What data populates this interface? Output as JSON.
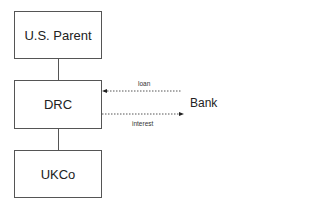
{
  "diagram": {
    "nodes": [
      {
        "id": "us_parent",
        "label": "U.S. Parent"
      },
      {
        "id": "drc",
        "label": "DRC"
      },
      {
        "id": "ukco",
        "label": "UKCo"
      },
      {
        "id": "bank",
        "label": "Bank"
      }
    ],
    "edges": [
      {
        "from": "us_parent",
        "to": "drc",
        "style": "solid"
      },
      {
        "from": "drc",
        "to": "ukco",
        "style": "solid"
      },
      {
        "from": "bank",
        "to": "drc",
        "label": "loan",
        "style": "dotted",
        "arrow": "to-drc"
      },
      {
        "from": "drc",
        "to": "bank",
        "label": "interest",
        "style": "dotted",
        "arrow": "to-bank"
      }
    ]
  }
}
